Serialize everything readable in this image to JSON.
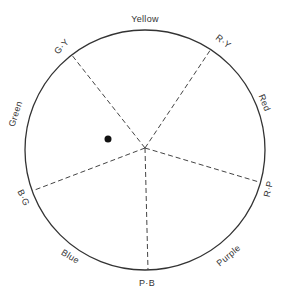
{
  "diagram": {
    "type": "color-wheel",
    "center": [
      145,
      150
    ],
    "radius": 120,
    "colors": {
      "stroke": "#333333",
      "spoke": "#444444",
      "dot": "#111111",
      "background": "#ffffff"
    },
    "hue_labels": [
      {
        "id": "yellow",
        "text": "Yellow",
        "x": 145,
        "y": 20,
        "rotate": 0
      },
      {
        "id": "red",
        "text": "Red",
        "x": 264,
        "y": 103,
        "rotate": 68
      },
      {
        "id": "purple",
        "text": "Purple",
        "x": 229,
        "y": 256,
        "rotate": -40
      },
      {
        "id": "blue",
        "text": "Blue",
        "x": 70,
        "y": 257,
        "rotate": 32
      },
      {
        "id": "green",
        "text": "Green",
        "x": 16,
        "y": 114,
        "rotate": -72
      }
    ],
    "boundary_labels": [
      {
        "id": "g-y",
        "text": "G·Y",
        "x": 62,
        "y": 47,
        "rotate": -47
      },
      {
        "id": "r-y",
        "text": "R·Y",
        "x": 223,
        "y": 42,
        "rotate": 38
      },
      {
        "id": "r-p",
        "text": "R·P",
        "x": 269,
        "y": 189,
        "rotate": -78
      },
      {
        "id": "p-b",
        "text": "P·B",
        "x": 147,
        "y": 284,
        "rotate": 0
      },
      {
        "id": "b-g",
        "text": "B·G",
        "x": 23,
        "y": 198,
        "rotate": 65
      }
    ],
    "spokes": [
      {
        "id": "g-y",
        "hub": [
          145,
          148
        ],
        "end": [
          71,
          54
        ]
      },
      {
        "id": "r-y",
        "hub": [
          145,
          148
        ],
        "end": [
          211,
          49
        ]
      },
      {
        "id": "r-p",
        "hub": [
          145,
          148
        ],
        "end": [
          259,
          182
        ]
      },
      {
        "id": "p-b",
        "hub": [
          145,
          148
        ],
        "end": [
          148,
          270
        ]
      },
      {
        "id": "b-g",
        "hub": [
          145,
          148
        ],
        "end": [
          32,
          191
        ]
      }
    ],
    "marker": {
      "x": 108,
      "y": 139,
      "r": 3.5
    }
  }
}
